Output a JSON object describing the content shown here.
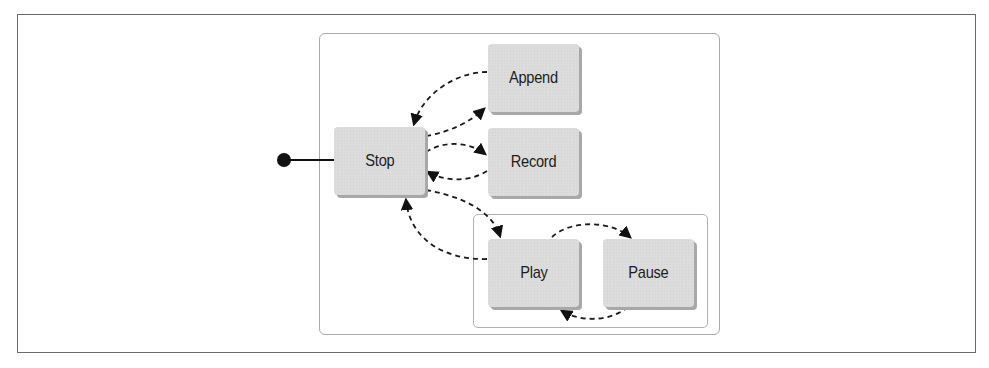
{
  "diagram": {
    "type": "state-machine",
    "initial_state": "Stop",
    "states": [
      {
        "id": "stop",
        "label": "Stop"
      },
      {
        "id": "append",
        "label": "Append"
      },
      {
        "id": "record",
        "label": "Record"
      },
      {
        "id": "play",
        "label": "Play"
      },
      {
        "id": "pause",
        "label": "Pause"
      }
    ],
    "groups": [
      {
        "id": "playback-group",
        "members": [
          "Play",
          "Pause"
        ]
      }
    ],
    "transitions": [
      {
        "from": "Stop",
        "to": "Append",
        "style": "dashed"
      },
      {
        "from": "Append",
        "to": "Stop",
        "style": "dashed"
      },
      {
        "from": "Stop",
        "to": "Record",
        "style": "dashed"
      },
      {
        "from": "Record",
        "to": "Stop",
        "style": "dashed"
      },
      {
        "from": "Stop",
        "to": "Play",
        "style": "dashed"
      },
      {
        "from": "Play",
        "to": "Stop",
        "style": "dashed"
      },
      {
        "from": "Play",
        "to": "Pause",
        "style": "dashed"
      },
      {
        "from": "Pause",
        "to": "Play",
        "style": "dashed"
      }
    ],
    "colors": {
      "node_fill": "#dcdcdc",
      "node_shadow": "#a8a8a8",
      "edge": "#1a1a1a",
      "border": "#6a6a6a"
    }
  }
}
